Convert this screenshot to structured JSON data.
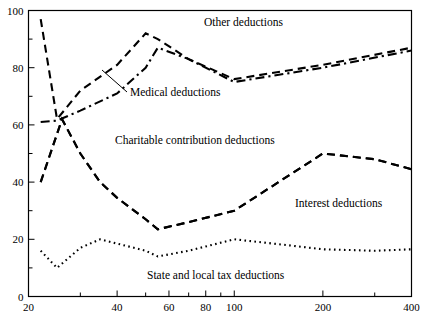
{
  "chart_data": {
    "type": "line",
    "title": "",
    "xlabel": "",
    "ylabel": "",
    "xscale": "log",
    "yscale": "linear",
    "xlim": [
      20,
      400
    ],
    "ylim": [
      0,
      100
    ],
    "grid": false,
    "legend_position": "inline-annotations",
    "x_ticks": [
      20,
      30,
      40,
      50,
      60,
      70,
      80,
      90,
      100,
      200,
      300,
      400
    ],
    "x_tick_labels": [
      "20",
      "",
      "40",
      "",
      "60",
      "",
      "80",
      "",
      "100",
      "200",
      "",
      "400"
    ],
    "y_ticks": [
      0,
      10,
      20,
      30,
      40,
      50,
      60,
      70,
      80,
      90,
      100
    ],
    "y_tick_labels": [
      "0",
      "",
      "20",
      "",
      "40",
      "",
      "60",
      "",
      "80",
      "",
      "100"
    ],
    "series": [
      {
        "name": "Other deductions",
        "style": "dashed",
        "x": [
          22,
          25,
          30,
          40,
          50,
          55,
          70,
          100,
          200,
          400
        ],
        "values": [
          97,
          62,
          72,
          81,
          92,
          90,
          83,
          76,
          81,
          87
        ]
      },
      {
        "name": "Medical deductions",
        "style": "dash-dot",
        "x": [
          22,
          25,
          30,
          40,
          50,
          55,
          70,
          100,
          200,
          400
        ],
        "values": [
          61,
          61.5,
          65,
          71,
          80,
          87,
          83,
          75,
          80,
          86
        ]
      },
      {
        "name": "Charitable contribution deductions",
        "style": "dashed",
        "x": [
          22,
          26,
          30,
          35,
          40,
          50,
          55,
          70,
          100,
          200,
          300,
          400
        ],
        "values": [
          40,
          62,
          50,
          40,
          34.5,
          27,
          23.5,
          26,
          30,
          50,
          48,
          44.5
        ]
      },
      {
        "name": "Interest deductions",
        "style": "dashed",
        "x": [
          22,
          26,
          30,
          35,
          40,
          50,
          55,
          70,
          100,
          200,
          300,
          400
        ],
        "values": [
          40,
          62,
          50,
          40,
          34.5,
          27,
          23.5,
          26,
          30,
          50,
          48,
          44.5
        ]
      },
      {
        "name": "State and local tax deductions",
        "style": "dotted",
        "x": [
          22,
          25,
          30,
          35,
          40,
          50,
          55,
          70,
          100,
          150,
          200,
          300,
          400
        ],
        "values": [
          16,
          10,
          17,
          20,
          18.5,
          16,
          14,
          16,
          20,
          18,
          16.5,
          16,
          16.5
        ]
      }
    ],
    "annotations": [
      {
        "text": "Other deductions",
        "x_px": 204,
        "y_px": 26,
        "anchor": "start",
        "name": "annotation-other-deductions"
      },
      {
        "text": "Medical deductions",
        "x_px": 130,
        "y_px": 96,
        "anchor": "start",
        "name": "annotation-medical-deductions",
        "leader": {
          "x1": 127,
          "y1": 92,
          "x2": 102,
          "y2": 70
        }
      },
      {
        "text": "Charitable contribution deductions",
        "x_px": 115,
        "y_px": 144,
        "anchor": "start",
        "name": "annotation-charitable-contribution-deductions"
      },
      {
        "text": "Interest deductions",
        "x_px": 295,
        "y_px": 207,
        "anchor": "start",
        "name": "annotation-interest-deductions"
      },
      {
        "text": "State and local tax deductions",
        "x_px": 147,
        "y_px": 279,
        "anchor": "start",
        "name": "annotation-state-and-local-tax-deductions"
      }
    ],
    "colors": {
      "axis": "#000000",
      "series": "#000000",
      "background": "#ffffff"
    }
  }
}
